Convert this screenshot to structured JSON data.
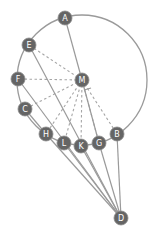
{
  "diagram": {
    "width": 157,
    "height": 239,
    "circle": {
      "cx": 82,
      "cy": 80,
      "r": 65
    },
    "colors": {
      "node_fill": "#656565",
      "node_text": "#ffffff",
      "line": "#9a9a9a"
    },
    "nodes": [
      {
        "id": "A",
        "label": "A",
        "x": 65,
        "y": 18
      },
      {
        "id": "E",
        "label": "E",
        "x": 29,
        "y": 45
      },
      {
        "id": "F",
        "label": "F",
        "x": 18,
        "y": 79
      },
      {
        "id": "C",
        "label": "C",
        "x": 25,
        "y": 109
      },
      {
        "id": "H",
        "label": "H",
        "x": 46,
        "y": 134
      },
      {
        "id": "L",
        "label": "L",
        "x": 64,
        "y": 143
      },
      {
        "id": "K",
        "label": "K",
        "x": 81,
        "y": 146
      },
      {
        "id": "G",
        "label": "G",
        "x": 99,
        "y": 143
      },
      {
        "id": "B",
        "label": "B",
        "x": 117,
        "y": 134
      },
      {
        "id": "M",
        "label": "M",
        "x": 82,
        "y": 80
      },
      {
        "id": "D",
        "label": "D",
        "x": 121,
        "y": 218
      }
    ],
    "dashed_edges": [
      [
        "M",
        "E"
      ],
      [
        "M",
        "F"
      ],
      [
        "M",
        "C"
      ],
      [
        "M",
        "H"
      ],
      [
        "M",
        "L"
      ],
      [
        "M",
        "K"
      ],
      [
        "M",
        "G"
      ],
      [
        "M",
        "B"
      ]
    ],
    "solid_edges": [
      [
        "A",
        "M"
      ],
      [
        "M",
        "G"
      ],
      [
        "E",
        "D"
      ],
      [
        "F",
        "D"
      ],
      [
        "C",
        "H"
      ],
      [
        "H",
        "D"
      ],
      [
        "L",
        "D"
      ],
      [
        "K",
        "D"
      ],
      [
        "G",
        "D"
      ],
      [
        "B",
        "D"
      ]
    ]
  }
}
